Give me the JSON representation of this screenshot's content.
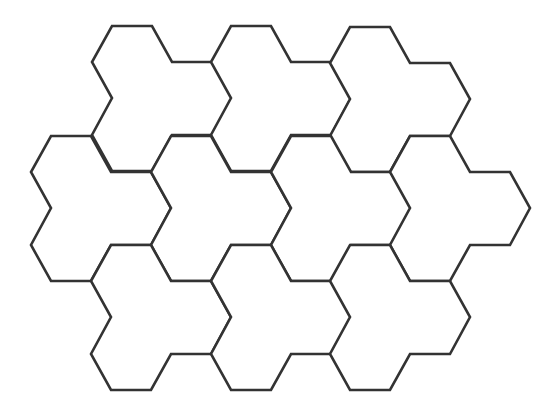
{
  "diagram": {
    "type": "tessellation",
    "stroke_color": "#333333",
    "background_color": "#ffffff",
    "tile_shape": {
      "name": "tri-hex",
      "relative_vertices": [
        [
          0,
          0
        ],
        [
          40,
          0
        ],
        [
          60,
          36
        ],
        [
          100,
          36
        ],
        [
          120,
          72
        ],
        [
          100,
          109
        ],
        [
          60,
          109
        ],
        [
          40,
          145
        ],
        [
          0,
          145
        ],
        [
          -20,
          109
        ],
        [
          0,
          72
        ],
        [
          -20,
          36
        ]
      ]
    },
    "tiles": [
      {
        "row": 1,
        "col": 1,
        "origin": [
          112,
          26
        ]
      },
      {
        "row": 1,
        "col": 2,
        "origin": [
          231,
          26
        ]
      },
      {
        "row": 1,
        "col": 3,
        "origin": [
          350,
          27
        ]
      },
      {
        "row": 2,
        "col": 1,
        "origin": [
          51,
          136
        ]
      },
      {
        "row": 2,
        "col": 2,
        "origin": [
          171,
          136
        ]
      },
      {
        "row": 2,
        "col": 3,
        "origin": [
          291,
          136
        ]
      },
      {
        "row": 2,
        "col": 4,
        "origin": [
          410,
          136
        ]
      },
      {
        "row": 3,
        "col": 1,
        "origin": [
          111,
          245
        ]
      },
      {
        "row": 3,
        "col": 2,
        "origin": [
          231,
          245
        ]
      },
      {
        "row": 3,
        "col": 3,
        "origin": [
          350,
          245
        ]
      }
    ],
    "tile_count": 10
  },
  "caption": {
    "text": "",
    "note": "caption text cut off at bottom edge; not legible"
  }
}
